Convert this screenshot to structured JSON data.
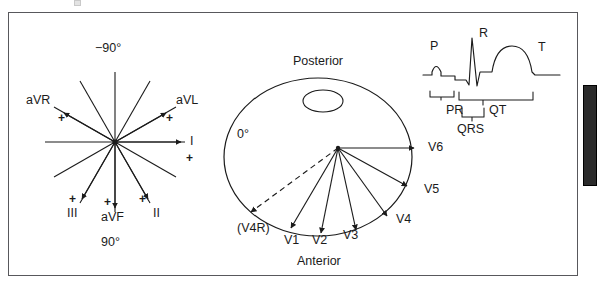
{
  "figure": {
    "background_color": "#ffffff",
    "frame_color": "#58585c",
    "ink_color": "#1b1b1b",
    "width": 600,
    "height": 290
  },
  "hexaxial": {
    "name": "Hexaxial reference system (frontal plane)",
    "center": {
      "x": 115,
      "y": 142
    },
    "angle_top_label": "−90°",
    "angle_bottom_label": "90°",
    "leads": [
      {
        "label": "aVR",
        "plus": "+",
        "angle_deg": -150
      },
      {
        "label": "aVL",
        "plus": "+",
        "angle_deg": -30
      },
      {
        "label": "I",
        "plus": "+",
        "angle_deg": 0
      },
      {
        "label": "II",
        "plus": "+",
        "angle_deg": 60
      },
      {
        "label": "aVF",
        "plus": "+",
        "angle_deg": 90
      },
      {
        "label": "III",
        "plus": "+",
        "angle_deg": 120
      }
    ]
  },
  "chest": {
    "name": "Transverse chest cross-section (horizontal plane)",
    "posterior_label": "Posterior",
    "anterior_label": "Anterior",
    "angle_label": "0°",
    "origin": {
      "x": 338,
      "y": 148
    },
    "precordial_leads": [
      {
        "label": "(V4R)",
        "style": "dashed"
      },
      {
        "label": "V1",
        "style": "solid"
      },
      {
        "label": "V2",
        "style": "solid"
      },
      {
        "label": "V3",
        "style": "solid"
      },
      {
        "label": "V4",
        "style": "solid"
      },
      {
        "label": "V5",
        "style": "solid"
      },
      {
        "label": "V6",
        "style": "solid"
      }
    ]
  },
  "ecg": {
    "name": "ECG complex with interval brackets",
    "wave_labels": [
      {
        "id": "p-wave-label",
        "label": "P"
      },
      {
        "id": "r-wave-label",
        "label": "R"
      },
      {
        "id": "t-wave-label",
        "label": "T"
      }
    ],
    "interval_labels": [
      {
        "id": "pr-interval-label",
        "label": "PR"
      },
      {
        "id": "qt-interval-label",
        "label": "QT"
      },
      {
        "id": "qrs-interval-label",
        "label": "QRS"
      }
    ]
  }
}
